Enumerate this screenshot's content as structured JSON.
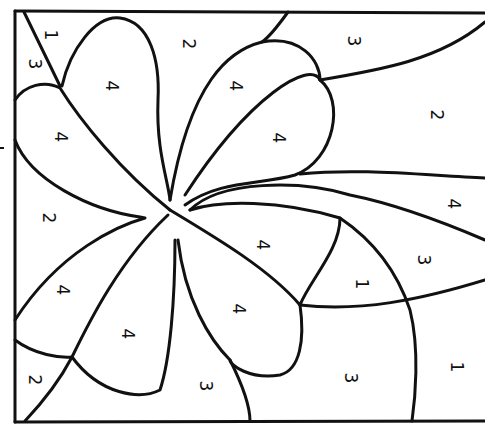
{
  "colors": {
    "line": "#111111",
    "background": "#ffffff"
  },
  "regions": [
    {
      "id": "r1",
      "number": "1",
      "x": 50,
      "y": 35
    },
    {
      "id": "r2",
      "number": "3",
      "x": 34,
      "y": 64
    },
    {
      "id": "r3",
      "number": "4",
      "x": 111,
      "y": 86
    },
    {
      "id": "r4",
      "number": "2",
      "x": 188,
      "y": 44
    },
    {
      "id": "r5",
      "number": "4",
      "x": 235,
      "y": 86
    },
    {
      "id": "r6",
      "number": "3",
      "x": 353,
      "y": 41
    },
    {
      "id": "r7",
      "number": "4",
      "x": 278,
      "y": 138
    },
    {
      "id": "r8",
      "number": "2",
      "x": 436,
      "y": 115
    },
    {
      "id": "r9",
      "number": "4",
      "x": 60,
      "y": 137
    },
    {
      "id": "r10",
      "number": "2",
      "x": 48,
      "y": 218
    },
    {
      "id": "r11",
      "number": "4",
      "x": 453,
      "y": 204
    },
    {
      "id": "r12",
      "number": "4",
      "x": 262,
      "y": 245
    },
    {
      "id": "r13",
      "number": "3",
      "x": 423,
      "y": 260
    },
    {
      "id": "r14",
      "number": "4",
      "x": 62,
      "y": 290
    },
    {
      "id": "r15",
      "number": "1",
      "x": 361,
      "y": 284
    },
    {
      "id": "r16",
      "number": "4",
      "x": 238,
      "y": 309
    },
    {
      "id": "r17",
      "number": "4",
      "x": 127,
      "y": 334
    },
    {
      "id": "r18",
      "number": "2",
      "x": 34,
      "y": 380
    },
    {
      "id": "r19",
      "number": "3",
      "x": 205,
      "y": 386
    },
    {
      "id": "r20",
      "number": "3",
      "x": 350,
      "y": 378
    },
    {
      "id": "r21",
      "number": "1",
      "x": 456,
      "y": 367
    }
  ]
}
